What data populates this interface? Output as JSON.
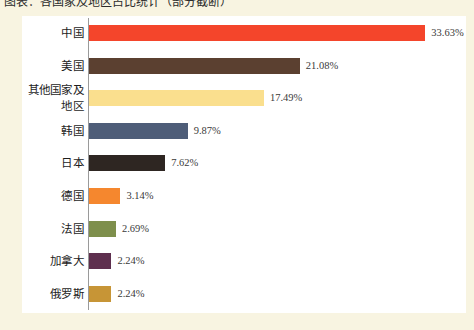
{
  "heading": {
    "text": "图表：各国家及地区占比统计（部分截断）"
  },
  "chart_data": {
    "type": "bar",
    "orientation": "horizontal",
    "title": "",
    "subtitle": "",
    "xlabel": "",
    "ylabel": "",
    "grid": false,
    "legend": "none",
    "xlim": [
      0,
      33.63
    ],
    "unit": "%",
    "value_suffix": "%",
    "categories": [
      "中国",
      "美国",
      "其他国家及地区",
      "韩国",
      "日本",
      "德国",
      "法国",
      "加拿大",
      "俄罗斯"
    ],
    "values": [
      33.63,
      21.08,
      17.49,
      9.87,
      7.62,
      3.14,
      2.69,
      2.24,
      2.24
    ],
    "value_labels": [
      "33.63%",
      "21.08%",
      "17.49%",
      "9.87%",
      "7.62%",
      "3.14%",
      "2.69%",
      "2.24%",
      "2.24%"
    ],
    "colors": [
      "#f4452b",
      "#5b4030",
      "#fadf8e",
      "#4e5d78",
      "#2e2622",
      "#f5872e",
      "#7e8f4c",
      "#5e2f4e",
      "#c79536"
    ],
    "bars": [
      {
        "label": "中国",
        "value": 33.63,
        "value_label": "33.63%",
        "color": "#f4452b"
      },
      {
        "label": "美国",
        "value": 21.08,
        "value_label": "21.08%",
        "color": "#5b4030"
      },
      {
        "label": "其他国家及地区",
        "value": 17.49,
        "value_label": "17.49%",
        "color": "#fadf8e"
      },
      {
        "label": "韩国",
        "value": 9.87,
        "value_label": "9.87%",
        "color": "#4e5d78"
      },
      {
        "label": "日本",
        "value": 7.62,
        "value_label": "7.62%",
        "color": "#2e2622"
      },
      {
        "label": "德国",
        "value": 3.14,
        "value_label": "3.14%",
        "color": "#f5872e"
      },
      {
        "label": "法国",
        "value": 2.69,
        "value_label": "2.69%",
        "color": "#7e8f4c"
      },
      {
        "label": "加拿大",
        "value": 2.24,
        "value_label": "2.24%",
        "color": "#5e2f4e"
      },
      {
        "label": "俄罗斯",
        "value": 2.24,
        "value_label": "2.24%",
        "color": "#c79536"
      }
    ]
  },
  "style": {
    "page_background": "#f8f4e1",
    "canvas_background": "#ffffff",
    "axis_color": "#9a9a9a",
    "label_color": "#1d1d1d",
    "value_color": "#3a3a3a"
  }
}
